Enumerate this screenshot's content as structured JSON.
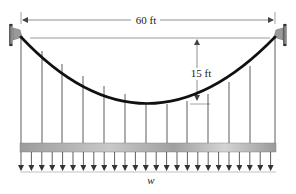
{
  "diagram": {
    "type": "suspension-cable",
    "span_label": "60 ft",
    "sag_label": "15 ft",
    "load_label": "w",
    "colors": {
      "cable": "#111111",
      "hanger": "#333333",
      "deck": "#b5b5b5",
      "support": "#8a8a8a",
      "dimension": "#444444"
    },
    "hanger_count": 13,
    "load_arrow_count": 25
  }
}
